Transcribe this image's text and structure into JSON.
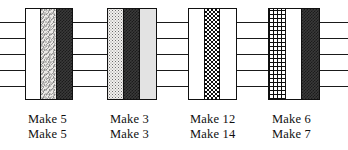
{
  "figure": {
    "type": "pattern-diagram",
    "width": 348,
    "height": 150,
    "background": "#ffffff",
    "line_color": "#1a1a1a",
    "text_color": "#0f0f0f"
  },
  "grid_lines": {
    "count": 5,
    "orientation": "horizontal",
    "y_positions": [
      22,
      38,
      54,
      70,
      86
    ]
  },
  "blocks": [
    {
      "id": "block-1",
      "x": 25,
      "width": 48,
      "columns": [
        {
          "fill": "white",
          "name": "plain-white"
        },
        {
          "fill": "mottle",
          "name": "light-mottled"
        },
        {
          "fill": "darkcheck",
          "name": "dark-checkered"
        }
      ],
      "labels": [
        "Make 5",
        "Make 5"
      ],
      "label_x": 28
    },
    {
      "id": "block-2",
      "x": 107,
      "width": 50,
      "columns": [
        {
          "fill": "stipple",
          "name": "light-stippled"
        },
        {
          "fill": "darkcheck",
          "name": "dark-checkered"
        },
        {
          "fill": "lightgray",
          "name": "light-gray-solid"
        }
      ],
      "labels": [
        "Make 3",
        "Make 3"
      ],
      "label_x": 110
    },
    {
      "id": "block-3",
      "x": 188,
      "width": 49,
      "columns": [
        {
          "fill": "white",
          "name": "plain-white"
        },
        {
          "fill": "check",
          "name": "high-contrast-checkered"
        },
        {
          "fill": "white",
          "name": "plain-white"
        }
      ],
      "labels": [
        "Make 12",
        "Make 14"
      ],
      "label_x": 190
    },
    {
      "id": "block-4",
      "x": 268,
      "width": 52,
      "columns": [
        {
          "fill": "grid",
          "name": "black-grid-crosshatch"
        },
        {
          "fill": "white",
          "name": "plain-white"
        },
        {
          "fill": "darkcheck",
          "name": "dark-checkered"
        }
      ],
      "labels": [
        "Make 6",
        "Make 7"
      ],
      "label_x": 272
    }
  ]
}
